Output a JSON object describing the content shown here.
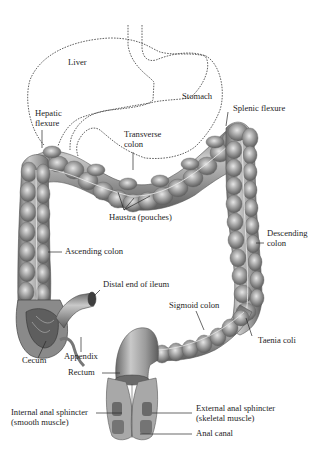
{
  "figure": {
    "colors": {
      "background": "#ffffff",
      "organ_fill": "#8f8f8f",
      "organ_dark": "#5a5a5a",
      "organ_light": "#d4d4d4",
      "outline_dashed": "#3a3a3a",
      "leader_line": "#2a2a2a",
      "label_text": "#1e1e1e"
    }
  },
  "labels": {
    "liver": "Liver",
    "stomach": "Stomach",
    "hepatic_flexure_1": "Hepatic",
    "hepatic_flexure_2": "flexure",
    "splenic_flexure": "Splenic flexure",
    "transverse_colon_1": "Transverse",
    "transverse_colon_2": "colon",
    "haustra": "Haustra (pouches)",
    "descending_colon_1": "Descending",
    "descending_colon_2": "colon",
    "ascending_colon": "Ascending colon",
    "distal_ileum": "Distal end of ileum",
    "sigmoid_colon": "Sigmoid colon",
    "taenia_coli": "Taenia coli",
    "cecum": "Cecum",
    "appendix": "Appendix",
    "rectum": "Rectum",
    "internal_sphincter_1": "Internal anal sphincter",
    "internal_sphincter_2": "(smooth muscle)",
    "external_sphincter_1": "External anal sphincter",
    "external_sphincter_2": "(skeletal muscle)",
    "anal_canal": "Anal canal"
  }
}
